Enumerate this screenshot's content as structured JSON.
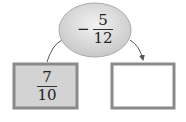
{
  "operator_node": {
    "sign": "−",
    "numerator": "5",
    "denominator": "12"
  },
  "input_box": {
    "numerator": "7",
    "denominator": "10"
  },
  "output_box": {
    "value": ""
  },
  "colors": {
    "ellipse_fill": "#d9d9d9",
    "box_fill": "#d3d3d3",
    "box_border": "#8a8a8a",
    "line": "#555555"
  }
}
